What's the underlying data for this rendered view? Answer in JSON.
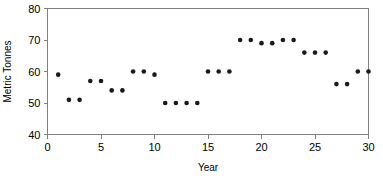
{
  "chart_data": {
    "type": "scatter",
    "title": "",
    "xlabel": "Year",
    "ylabel": "Metric Tonnes",
    "xlim": [
      0,
      30
    ],
    "ylim": [
      40,
      80
    ],
    "xticks": [
      0,
      5,
      10,
      15,
      20,
      25,
      30
    ],
    "yticks": [
      40,
      50,
      60,
      70,
      80
    ],
    "xtick_labels": [
      "0",
      "5",
      "10",
      "15",
      "20",
      "25",
      "30"
    ],
    "ytick_labels": [
      "40",
      "50",
      "60",
      "70",
      "80"
    ],
    "grid": false,
    "legend": false,
    "marker": "circle",
    "marker_color": "#1a1a1a",
    "x": [
      1,
      2,
      3,
      4,
      5,
      6,
      7,
      8,
      9,
      10,
      11,
      12,
      13,
      14,
      15,
      16,
      17,
      18,
      19,
      20,
      21,
      22,
      23,
      24,
      25,
      26,
      27,
      28,
      29,
      30
    ],
    "values": [
      59,
      51,
      51,
      57,
      57,
      54,
      54,
      60,
      60,
      59,
      50,
      50,
      50,
      50,
      60,
      60,
      60,
      70,
      70,
      69,
      69,
      70,
      70,
      66,
      66,
      66,
      56,
      56,
      60,
      60
    ],
    "series": [
      {
        "name": "Metric Tonnes",
        "values": [
          59,
          51,
          51,
          57,
          57,
          54,
          54,
          60,
          60,
          59,
          50,
          50,
          50,
          50,
          60,
          60,
          60,
          70,
          70,
          69,
          69,
          70,
          70,
          66,
          66,
          66,
          56,
          56,
          60,
          60
        ]
      }
    ]
  },
  "axes": {
    "x_title": "Year",
    "y_title": "Metric Tonnes"
  }
}
